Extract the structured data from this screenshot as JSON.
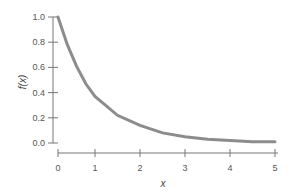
{
  "chart_data": {
    "type": "line",
    "title": "",
    "xlabel": "x",
    "ylabel": "f(x)",
    "xlim": [
      0,
      5
    ],
    "ylim": [
      0,
      1
    ],
    "x_ticks": [
      "0",
      "1",
      "2",
      "3",
      "4",
      "5"
    ],
    "y_ticks": [
      "0.0",
      "0.2",
      "0.4",
      "0.6",
      "0.8",
      "1.0"
    ],
    "grid": false,
    "legend": null,
    "series": [
      {
        "name": "f(x)",
        "color": "#8c8c8c",
        "x": [
          0,
          0.25,
          0.5,
          0.75,
          1,
          1.5,
          2,
          2.5,
          3,
          3.5,
          4,
          4.5,
          5
        ],
        "values": [
          1.0,
          0.78,
          0.61,
          0.47,
          0.37,
          0.22,
          0.14,
          0.08,
          0.05,
          0.03,
          0.02,
          0.01,
          0.01
        ]
      }
    ]
  },
  "axes": {
    "x_title": "x",
    "y_title": "f(x)"
  }
}
